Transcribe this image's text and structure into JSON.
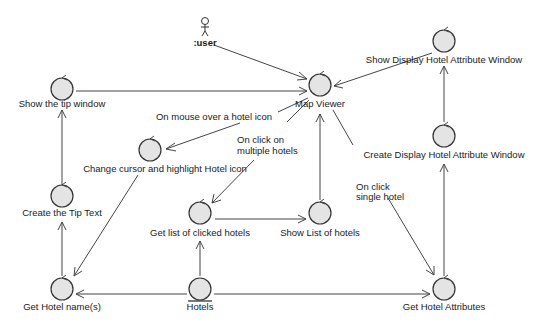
{
  "diagram": {
    "type": "UML robustness / collaboration diagram",
    "actor": {
      "label": ":user"
    },
    "nodes": [
      {
        "id": "map_viewer",
        "label": "Map Viewer",
        "kind": "control"
      },
      {
        "id": "show_display_window",
        "label": "Show Display Hotel Attribute Window",
        "kind": "control"
      },
      {
        "id": "create_display_window",
        "label": "Create Display Hotel Attribute Window",
        "kind": "control"
      },
      {
        "id": "show_tip_window",
        "label": "Show the tip window",
        "kind": "control"
      },
      {
        "id": "change_cursor",
        "label": "Change cursor and highlight Hotel icon",
        "kind": "control"
      },
      {
        "id": "create_tip_text",
        "label": "Create the Tip Text",
        "kind": "control"
      },
      {
        "id": "get_list_clicked",
        "label": "Get list of clicked hotels",
        "kind": "control"
      },
      {
        "id": "show_list_hotels",
        "label": "Show List of hotels",
        "kind": "control"
      },
      {
        "id": "get_hotel_names",
        "label": "Get Hotel name(s)",
        "kind": "control"
      },
      {
        "id": "hotels",
        "label": "Hotels",
        "kind": "entity"
      },
      {
        "id": "get_hotel_attributes",
        "label": "Get Hotel Attributes",
        "kind": "control"
      }
    ],
    "edge_labels": {
      "mouse_over": "On mouse over a hotel icon",
      "click_multiple_line1": "On click on",
      "click_multiple_line2": "multiple hotels",
      "click_single_line1": "On click",
      "click_single_line2": "single hotel"
    },
    "edges": [
      {
        "from": ":user",
        "to": "Map Viewer"
      },
      {
        "from": "Show the tip window",
        "to": "Map Viewer"
      },
      {
        "from": "Show Display Hotel Attribute Window",
        "to": "Map Viewer"
      },
      {
        "from": "Map Viewer",
        "to": "Change cursor and highlight Hotel icon",
        "label": "On mouse over a hotel icon"
      },
      {
        "from": "Map Viewer",
        "to": "Get list of clicked hotels",
        "label": "On click on multiple hotels"
      },
      {
        "from": "Show List of hotels",
        "to": "Map Viewer"
      },
      {
        "from": "Map Viewer",
        "to": "Get Hotel Attributes",
        "label": "On click single hotel"
      },
      {
        "from": "Create Display Hotel Attribute Window",
        "to": "Show Display Hotel Attribute Window"
      },
      {
        "from": "Get Hotel Attributes",
        "to": "Create Display Hotel Attribute Window"
      },
      {
        "from": "Change cursor and highlight Hotel icon",
        "to": "Get Hotel name(s)"
      },
      {
        "from": "Create the Tip Text",
        "to": "Show the tip window"
      },
      {
        "from": "Get Hotel name(s)",
        "to": "Create the Tip Text"
      },
      {
        "from": "Get list of clicked hotels",
        "to": "Show List of hotels"
      },
      {
        "from": "Hotels",
        "to": "Get list of clicked hotels"
      },
      {
        "from": "Hotels",
        "to": "Get Hotel name(s)"
      },
      {
        "from": "Hotels",
        "to": "Get Hotel Attributes"
      }
    ]
  }
}
